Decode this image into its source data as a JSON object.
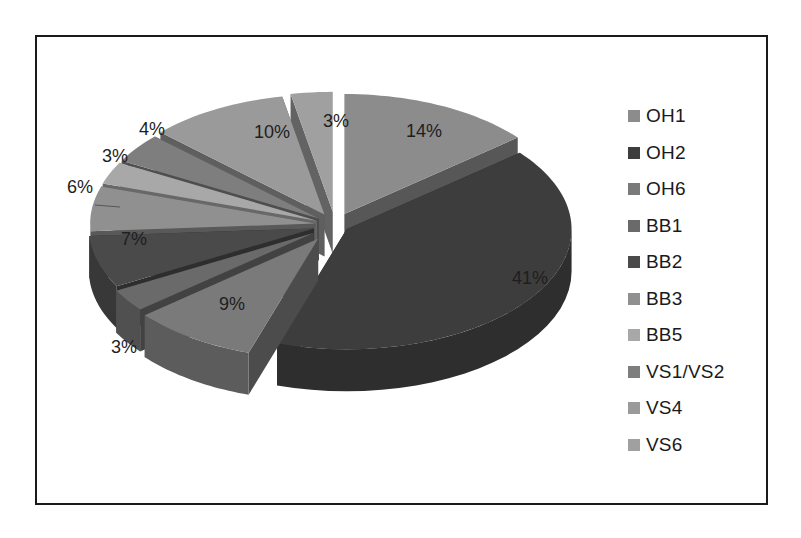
{
  "chart_data": {
    "type": "pie",
    "style": "3d-exploded",
    "title": "",
    "categories": [
      "OH1",
      "OH2",
      "OH6",
      "BB1",
      "BB2",
      "BB3",
      "BB5",
      "VS1/VS2",
      "VS4",
      "VS6"
    ],
    "values": [
      14,
      41,
      9,
      3,
      7,
      6,
      3,
      4,
      10,
      3
    ],
    "labels": [
      "14%",
      "41%",
      "9%",
      "3%",
      "7%",
      "6%",
      "3%",
      "4%",
      "10%",
      "3%"
    ],
    "colors": [
      "#8c8c8c",
      "#3d3d3d",
      "#7a7a7a",
      "#6a6a6a",
      "#4a4a4a",
      "#909090",
      "#a8a8a8",
      "#7e7e7e",
      "#9a9a9a",
      "#a0a0a0"
    ],
    "legend_position": "right",
    "start_angle_deg": 0,
    "direction": "clockwise"
  },
  "legend": {
    "items": [
      {
        "label": "OH1",
        "color": "#8c8c8c"
      },
      {
        "label": "OH2",
        "color": "#3d3d3d"
      },
      {
        "label": "OH6",
        "color": "#7a7a7a"
      },
      {
        "label": "BB1",
        "color": "#6a6a6a"
      },
      {
        "label": "BB2",
        "color": "#4a4a4a"
      },
      {
        "label": "BB3",
        "color": "#909090"
      },
      {
        "label": "BB5",
        "color": "#a8a8a8"
      },
      {
        "label": "VS1/VS2",
        "color": "#7e7e7e"
      },
      {
        "label": "VS4",
        "color": "#9a9a9a"
      },
      {
        "label": "VS6",
        "color": "#a0a0a0"
      }
    ]
  }
}
